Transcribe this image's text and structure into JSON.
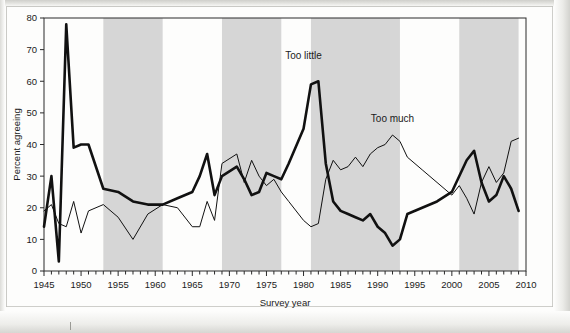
{
  "chart_data": {
    "type": "line",
    "title": "",
    "xlabel": "Survey year",
    "ylabel": "Percent agreeing",
    "xlim": [
      1945,
      2010
    ],
    "ylim": [
      0,
      80
    ],
    "xticks": [
      1945,
      1950,
      1955,
      1960,
      1965,
      1970,
      1975,
      1980,
      1985,
      1990,
      1995,
      2000,
      2005,
      2010
    ],
    "yticks": [
      0,
      10,
      20,
      30,
      40,
      50,
      60,
      70,
      80
    ],
    "minor_tick_step": 1,
    "grid": false,
    "legend_position": "inline-annotations",
    "shaded_bands": [
      {
        "start": 1953,
        "end": 1961,
        "color": "#d6d6d6"
      },
      {
        "start": 1969,
        "end": 1977,
        "color": "#d6d6d6"
      },
      {
        "start": 1981,
        "end": 1993,
        "color": "#d6d6d6"
      },
      {
        "start": 2001,
        "end": 2009,
        "color": "#d6d6d6"
      }
    ],
    "series": [
      {
        "name": "Too little",
        "style": "thick",
        "color": "#111111",
        "linewidth": 2.6,
        "annotation": {
          "text": "Too little",
          "x": 1980,
          "y": 67
        },
        "points": [
          [
            1945,
            14
          ],
          [
            1946,
            30
          ],
          [
            1947,
            3
          ],
          [
            1948,
            78
          ],
          [
            1949,
            39
          ],
          [
            1950,
            40
          ],
          [
            1951,
            40
          ],
          [
            1953,
            26
          ],
          [
            1955,
            25
          ],
          [
            1957,
            22
          ],
          [
            1959,
            21
          ],
          [
            1961,
            21
          ],
          [
            1963,
            23
          ],
          [
            1965,
            25
          ],
          [
            1966,
            30
          ],
          [
            1967,
            37
          ],
          [
            1968,
            24
          ],
          [
            1969,
            30
          ],
          [
            1971,
            33
          ],
          [
            1972,
            29
          ],
          [
            1973,
            24
          ],
          [
            1974,
            25
          ],
          [
            1975,
            31
          ],
          [
            1976,
            30
          ],
          [
            1977,
            29
          ],
          [
            1978,
            34
          ],
          [
            1980,
            45
          ],
          [
            1981,
            59
          ],
          [
            1982,
            60
          ],
          [
            1983,
            34
          ],
          [
            1984,
            22
          ],
          [
            1985,
            19
          ],
          [
            1986,
            18
          ],
          [
            1987,
            17
          ],
          [
            1988,
            16
          ],
          [
            1989,
            18
          ],
          [
            1990,
            14
          ],
          [
            1991,
            12
          ],
          [
            1992,
            8
          ],
          [
            1993,
            10
          ],
          [
            1994,
            18
          ],
          [
            1996,
            20
          ],
          [
            1998,
            22
          ],
          [
            2000,
            25
          ],
          [
            2002,
            35
          ],
          [
            2003,
            38
          ],
          [
            2004,
            28
          ],
          [
            2005,
            22
          ],
          [
            2006,
            24
          ],
          [
            2007,
            30
          ],
          [
            2008,
            26
          ],
          [
            2009,
            19
          ]
        ]
      },
      {
        "name": "Too much",
        "style": "thin",
        "color": "#111111",
        "linewidth": 1.0,
        "annotation": {
          "text": "Too much",
          "x": 1992,
          "y": 47
        },
        "points": [
          [
            1945,
            19
          ],
          [
            1946,
            21
          ],
          [
            1947,
            15
          ],
          [
            1948,
            14
          ],
          [
            1949,
            22
          ],
          [
            1950,
            12
          ],
          [
            1951,
            19
          ],
          [
            1953,
            21
          ],
          [
            1955,
            17
          ],
          [
            1957,
            10
          ],
          [
            1959,
            18
          ],
          [
            1961,
            21
          ],
          [
            1963,
            20
          ],
          [
            1965,
            14
          ],
          [
            1966,
            14
          ],
          [
            1967,
            22
          ],
          [
            1968,
            16
          ],
          [
            1969,
            34
          ],
          [
            1971,
            37
          ],
          [
            1972,
            28
          ],
          [
            1973,
            35
          ],
          [
            1974,
            30
          ],
          [
            1975,
            27
          ],
          [
            1976,
            29
          ],
          [
            1977,
            25
          ],
          [
            1978,
            22
          ],
          [
            1980,
            16
          ],
          [
            1981,
            14
          ],
          [
            1982,
            15
          ],
          [
            1983,
            29
          ],
          [
            1984,
            35
          ],
          [
            1985,
            32
          ],
          [
            1986,
            33
          ],
          [
            1987,
            36
          ],
          [
            1988,
            33
          ],
          [
            1989,
            37
          ],
          [
            1990,
            39
          ],
          [
            1991,
            40
          ],
          [
            1992,
            43
          ],
          [
            1993,
            41
          ],
          [
            1994,
            36
          ],
          [
            1996,
            32
          ],
          [
            1998,
            28
          ],
          [
            2000,
            24
          ],
          [
            2001,
            27
          ],
          [
            2002,
            23
          ],
          [
            2003,
            18
          ],
          [
            2004,
            28
          ],
          [
            2005,
            33
          ],
          [
            2006,
            28
          ],
          [
            2007,
            31
          ],
          [
            2008,
            41
          ],
          [
            2009,
            42
          ]
        ]
      }
    ]
  }
}
